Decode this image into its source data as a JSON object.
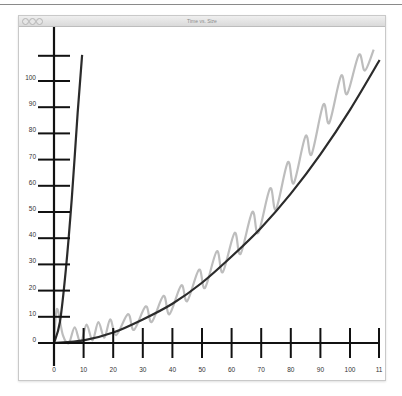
{
  "window": {
    "title": "Time vs. Size",
    "traffic_lights": [
      "close-button",
      "minimize-button",
      "zoom-button"
    ]
  },
  "colors": {
    "axis": "#111111",
    "fit_curve": "#2b2b2b",
    "steep_curve": "#2b2b2b",
    "measured": "#bdbdbd"
  },
  "axes": {
    "x_ticks": [
      "0",
      "10",
      "20",
      "30",
      "40",
      "50",
      "60",
      "70",
      "80",
      "90",
      "100",
      "11"
    ],
    "y_ticks": [
      "0",
      "10",
      "20",
      "30",
      "40",
      "50",
      "60",
      "70",
      "80",
      "90",
      "100"
    ]
  },
  "chart_data": {
    "type": "line",
    "title": "Time vs. Size",
    "xlabel": "",
    "ylabel": "",
    "xlim": [
      0,
      110
    ],
    "ylim": [
      0,
      110
    ],
    "grid": false,
    "legend": null,
    "x_tick_labels": [
      "0",
      "10",
      "20",
      "30",
      "40",
      "50",
      "60",
      "70",
      "80",
      "90",
      "100",
      "11"
    ],
    "y_tick_labels": [
      "0",
      "10",
      "20",
      "30",
      "40",
      "50",
      "60",
      "70",
      "80",
      "90",
      "100"
    ],
    "series": [
      {
        "name": "steep curve (dark)",
        "style": "dark thick line",
        "x": [
          0,
          2,
          4,
          6,
          8,
          9.5
        ],
        "y": [
          0,
          8,
          28,
          55,
          88,
          110
        ]
      },
      {
        "name": "fit curve (dark, ~quadratic)",
        "style": "dark thick line",
        "x": [
          0,
          10,
          20,
          30,
          40,
          50,
          60,
          70,
          80,
          90,
          100,
          110
        ],
        "y": [
          0,
          1,
          4,
          9,
          15,
          23,
          33,
          44,
          57,
          72,
          89,
          108
        ]
      },
      {
        "name": "measured (light gray, oscillating)",
        "style": "light gray line",
        "x": [
          0,
          1,
          3,
          5,
          7,
          9,
          11,
          13,
          15,
          17,
          19,
          21,
          25,
          27,
          31,
          33,
          37,
          39,
          43,
          45,
          49,
          51,
          55,
          57,
          61,
          63,
          67,
          69,
          73,
          75,
          79,
          81,
          85,
          87,
          91,
          93,
          97,
          99,
          103,
          105,
          108
        ],
        "y": [
          0,
          13,
          3,
          0,
          6,
          0,
          7,
          1,
          8,
          2,
          9,
          3,
          11,
          5,
          14,
          8,
          18,
          11,
          22,
          16,
          28,
          21,
          35,
          27,
          42,
          34,
          50,
          42,
          59,
          51,
          69,
          61,
          79,
          72,
          91,
          84,
          102,
          95,
          110,
          104,
          112
        ]
      }
    ]
  }
}
